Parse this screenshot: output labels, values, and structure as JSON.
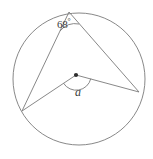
{
  "figure": {
    "type": "circle-geometry-diagram",
    "width": 153,
    "height": 159,
    "background_color": "#ffffff",
    "stroke_color": "#7a7a7a",
    "text_color": "#3b3b3b"
  },
  "labels": {
    "inscribed_angle_value": "68",
    "degree_symbol": "°",
    "central_angle_value": "a"
  },
  "geometry": {
    "circle": {
      "center_x": 79,
      "center_y": 79,
      "radius": 66
    },
    "center_point": {
      "x": 76,
      "y": 75,
      "radius": 2.1
    },
    "vertices": {
      "top": {
        "x": 69,
        "y": 12
      },
      "left": {
        "x": 22,
        "y": 111
      },
      "right": {
        "x": 139,
        "y": 92
      }
    },
    "chords": [
      {
        "name": "top-to-left",
        "x1": 69,
        "y1": 12,
        "x2": 22,
        "y2": 111
      },
      {
        "name": "top-to-right",
        "x1": 69,
        "y1": 12,
        "x2": 139,
        "y2": 92
      }
    ],
    "radii": [
      {
        "name": "center-to-left",
        "x1": 76,
        "y1": 75,
        "x2": 22,
        "y2": 111
      },
      {
        "name": "center-to-right",
        "x1": 76,
        "y1": 75,
        "x2": 139,
        "y2": 92
      }
    ],
    "inscribed_angle_arc": {
      "start_x": 60,
      "start_y": 31,
      "end_x": 79,
      "end_y": 24,
      "sweep_radius": 20
    },
    "central_angle_arc": {
      "start_x": 64,
      "start_y": 83,
      "end_x": 91,
      "end_y": 79,
      "sweep_radius": 15
    }
  }
}
